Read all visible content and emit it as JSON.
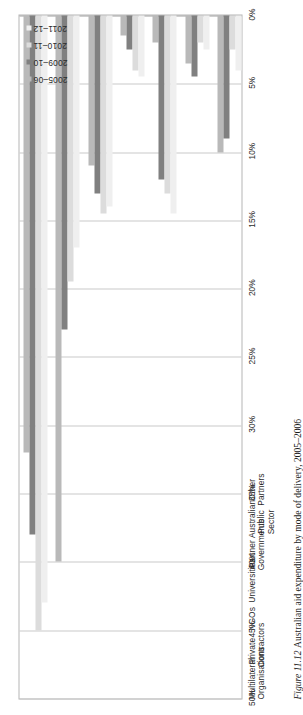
{
  "caption": {
    "figure_number": "Figure 11.12",
    "text": "Australian aid expenditure by mode of delivery, 2005–2006"
  },
  "legend": {
    "entries": [
      {
        "label": "2005–06",
        "color": "#b9b9b9"
      },
      {
        "label": "2009–10",
        "color": "#808080"
      },
      {
        "label": "2010–11",
        "color": "#dcdcdc"
      },
      {
        "label": "2011–12",
        "color": "#efefef"
      }
    ]
  },
  "axis": {
    "percent_ticks": [
      "50%",
      "45%",
      "40%",
      "35%",
      "30%",
      "25%",
      "20%",
      "15%",
      "10%",
      "5%",
      "0%"
    ]
  },
  "chart_data": {
    "type": "bar",
    "orientation": "horizontal",
    "title": "Australian aid expenditure by mode of delivery, 2005–2006",
    "xlabel": "",
    "ylabel": "",
    "xlim": [
      0,
      50
    ],
    "grid": true,
    "legend_position": "top-right",
    "tick_labels": [
      "0%",
      "5%",
      "10%",
      "15%",
      "20%",
      "25%",
      "30%",
      "35%",
      "40%",
      "45%",
      "50%"
    ],
    "categories": [
      "Multilateral Organisations",
      "Private Contractors",
      "NGOs",
      "Universities",
      "Partner Governments",
      "Australian Public Sector",
      "Other Partners"
    ],
    "series": [
      {
        "name": "2005–06",
        "color": "#b9b9b9",
        "values": [
          32,
          40,
          11,
          1.5,
          2,
          3.5,
          10
        ]
      },
      {
        "name": "2009–10",
        "color": "#808080",
        "values": [
          38,
          23,
          13,
          2.5,
          12,
          4.5,
          9
        ]
      },
      {
        "name": "2010–11",
        "color": "#dcdcdc",
        "values": [
          45,
          19.5,
          14.5,
          4,
          13,
          2,
          2.5
        ]
      },
      {
        "name": "2011–12",
        "color": "#efefef",
        "values": [
          43,
          17,
          14,
          4.5,
          14.5,
          2.5,
          4
        ]
      }
    ]
  }
}
